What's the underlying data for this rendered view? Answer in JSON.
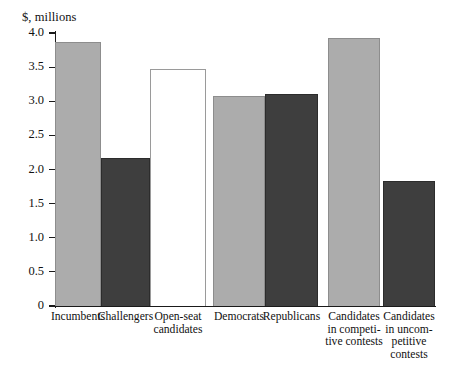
{
  "chart_data": {
    "type": "bar",
    "title": "",
    "ylabel": "$, millions",
    "xlabel": "",
    "ylim": [
      0,
      4.0
    ],
    "ytick_labels": [
      "0",
      "0.5",
      "1.0",
      "1.5",
      "2.0",
      "2.5",
      "3.0",
      "3.5",
      "4.0"
    ],
    "ytick_values": [
      0,
      0.5,
      1.0,
      1.5,
      2.0,
      2.5,
      3.0,
      3.5,
      4.0
    ],
    "grid": false,
    "legend": "none",
    "categories": [
      "Incumbents",
      "Challengers",
      "Open-seat\ncandidates",
      "Democrats",
      "Republicans",
      "Candidates\nin competi-\ntive contests",
      "Candidates\nin uncom-\npetitive\ncontests"
    ],
    "values": [
      3.87,
      2.17,
      3.47,
      3.08,
      3.11,
      3.93,
      1.83
    ],
    "bar_fills": [
      "light",
      "dark",
      "white",
      "light",
      "dark",
      "light",
      "dark"
    ],
    "groups": [
      {
        "name": "candidate-status",
        "members": [
          0,
          1,
          2
        ]
      },
      {
        "name": "party",
        "members": [
          3,
          4
        ]
      },
      {
        "name": "contest-competitiveness",
        "members": [
          5,
          6
        ]
      }
    ]
  },
  "colors": {
    "light_bar": "#acacac",
    "dark_bar": "#3e3e3e",
    "white_bar": "#ffffff",
    "axis": "#1a1a1a",
    "background": "#ffffff"
  }
}
